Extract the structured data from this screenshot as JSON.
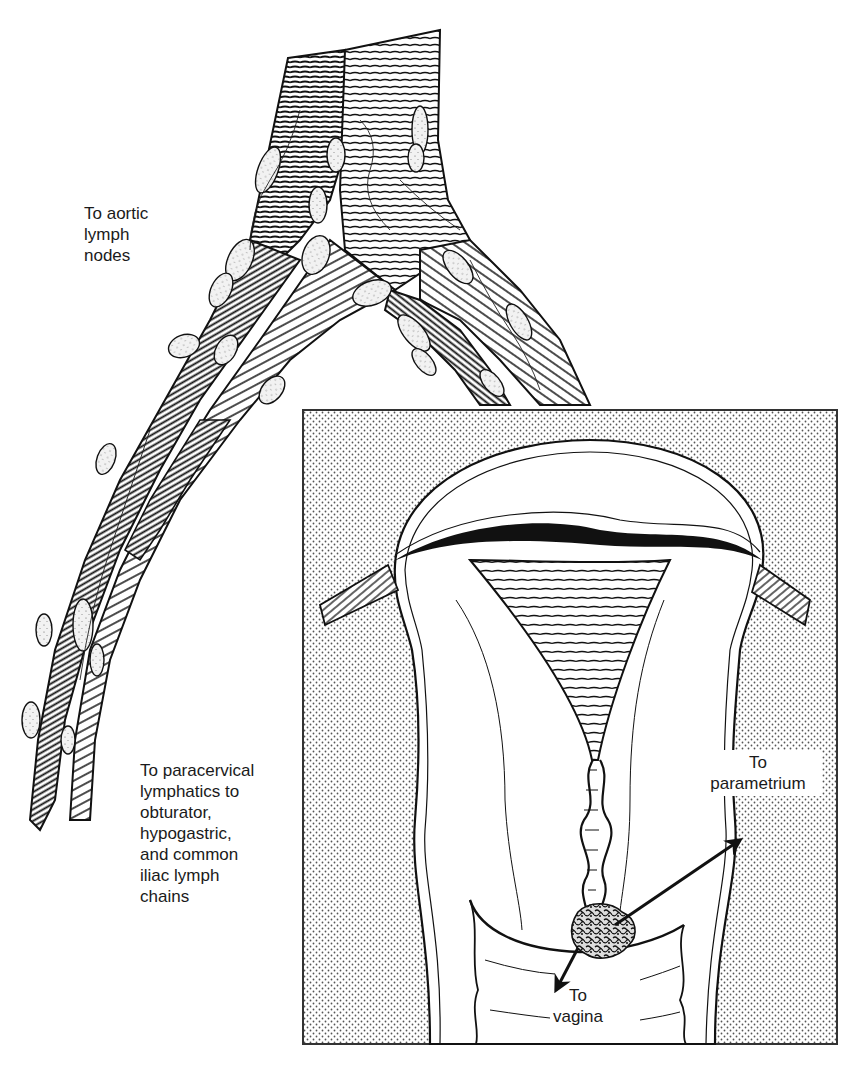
{
  "figure": {
    "colors": {
      "ink": "#111111",
      "paper": "#ffffff",
      "stipple_dot": "#555555",
      "inset_border": "#333333",
      "lymph_node_fill": "#f2f2f2"
    }
  },
  "labels": {
    "aortic": "To aortic\nlymph\nnodes",
    "paracervical": "To paracervical\nlymphatics to\nobturator,\nhypogastric,\nand common\niliac lymph\nchains",
    "parametrium": "To\nparametrium",
    "vagina": "To\nvagina"
  },
  "structures": {
    "vessels": "aorta and vena cava bifurcating into common iliac vessels with lymph nodes",
    "inset": "coronal section of uterus and cervix with tumor at external os",
    "arrows": [
      "tumor-to-parametrium-arrow",
      "tumor-to-vagina-arrow"
    ]
  }
}
